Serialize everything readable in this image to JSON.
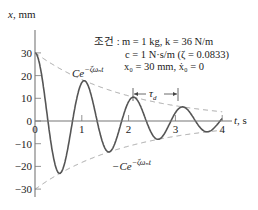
{
  "chart_data": {
    "type": "line",
    "title": "",
    "xlabel": "t, s",
    "ylabel": "x, mm",
    "xlim": [
      0,
      4
    ],
    "ylim": [
      -30,
      30
    ],
    "x_ticks": [
      "0",
      "1",
      "2",
      "3",
      "4"
    ],
    "y_ticks": [
      "30",
      "20",
      "10",
      "0",
      "-10",
      "-20",
      "-30"
    ],
    "grid": false,
    "legend": "none",
    "conditions": {
      "prefix": "조건 :",
      "line1": "m = 1 kg, k = 36 N/m",
      "line2": "c = 1 N·s/m (ζ = 0.0833)",
      "line3": "x₀ = 30 mm, ẋ₀ = 0"
    },
    "parameters": {
      "m": 1,
      "k": 36,
      "c": 1,
      "zeta": 0.0833,
      "x0": 30,
      "v0": 0
    },
    "series": [
      {
        "name": "x(t) damped response",
        "style": "solid",
        "x": [
          0,
          0.25,
          0.5,
          0.75,
          1.0,
          1.25,
          1.5,
          1.75,
          2.0,
          2.25,
          2.5,
          2.75,
          3.0,
          3.25,
          3.5,
          3.75,
          4.0
        ],
        "y": [
          30,
          0.7,
          -22,
          -0.5,
          16,
          0.4,
          -12,
          -0.3,
          9,
          0.2,
          -7,
          -0.2,
          6,
          0.1,
          -4,
          -0.1,
          3
        ]
      },
      {
        "name": "Ce^{-ζω_n t}",
        "style": "dashed",
        "x": [
          0,
          1,
          2,
          3,
          4
        ],
        "y": [
          30,
          18.5,
          11.5,
          7,
          4.4
        ]
      },
      {
        "name": "-Ce^{-ζω_n t}",
        "style": "dashed",
        "x": [
          0,
          1,
          2,
          3,
          4
        ],
        "y": [
          -30,
          -18.5,
          -11.5,
          -7,
          -4.4
        ]
      }
    ],
    "annotations": {
      "upper_envelope": "Ce",
      "upper_exp": "−ζωₙt",
      "lower_envelope": "−Ce",
      "lower_exp": "−ζωₙt",
      "period": "τ",
      "period_sub": "d"
    }
  }
}
